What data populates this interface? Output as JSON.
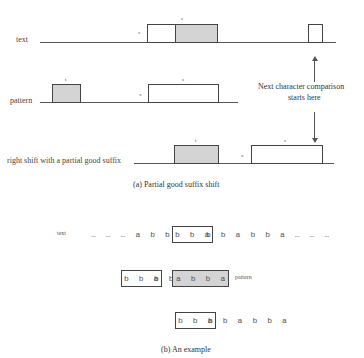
{
  "part_a": {
    "rows": {
      "text": "text",
      "pattern": "pattern",
      "shift": "right shift with a partial good suffix"
    },
    "labels": {
      "text_s": "s",
      "text_z": "z",
      "pattern_t": "t",
      "pattern_s": "s",
      "pattern_x": "x",
      "shift_t": "t",
      "shift_x": "x",
      "shift_s": "s"
    },
    "annotation_line1": "Next character comparison",
    "annotation_line2": "starts here",
    "caption": "(a) Partial good suffix shift"
  },
  "part_b": {
    "text_label": "text",
    "text_prefix": "… … … a b b a a",
    "text_boxed": "b b a",
    "text_suffix": "b b a b b a … … …",
    "pattern_boxed": "b b a",
    "pattern_middle": "b b",
    "pattern_shaded": "a b b a",
    "pattern_label": "pattern",
    "shifted_boxed": "b b a",
    "shifted_rest": "b b a b b a",
    "caption": "(b) An example"
  }
}
